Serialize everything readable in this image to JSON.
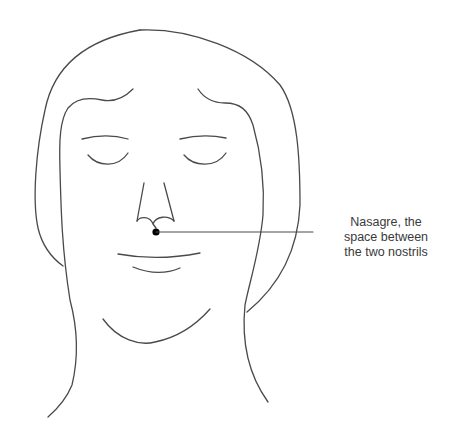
{
  "diagram": {
    "type": "face-acupoint-illustration",
    "annotation": {
      "lines": [
        "Nasagre, the",
        "space between",
        "the two nostrils"
      ],
      "point_name": "Nasagre",
      "description": "the space between the two nostrils"
    },
    "colors": {
      "stroke": "#4a4a4a",
      "point": "#000000",
      "background": "#ffffff"
    }
  }
}
